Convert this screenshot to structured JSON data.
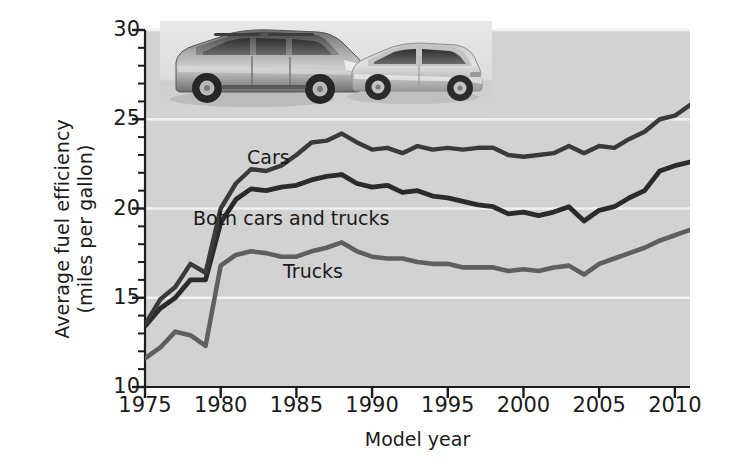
{
  "chart_data": {
    "type": "line",
    "title": "",
    "subtitle": "",
    "xlabel": "Model year",
    "ylabel": "Average fuel efficiency (miles per gallon)",
    "ylabel_line1": "Average fuel efficiency",
    "ylabel_line2": "(miles per gallon)",
    "xlim": [
      1975,
      2011
    ],
    "ylim": [
      10,
      30
    ],
    "xticks": [
      1975,
      1980,
      1985,
      1990,
      1995,
      2000,
      2005,
      2010
    ],
    "xtick_labels": [
      "1975",
      "1980",
      "1985",
      "1990",
      "1995",
      "2000",
      "2005",
      "2010"
    ],
    "yticks": [
      10,
      15,
      20,
      25,
      30
    ],
    "ytick_labels": [
      "10",
      "15",
      "20",
      "25",
      "30"
    ],
    "y_minor_tick_step": 1,
    "grid": "horizontal-white-gridlines-at-major-yticks",
    "legend": "inline-labels-on-curves",
    "plot_background": "#d2d2d2",
    "gridline_color": "#f2f2f2",
    "x": [
      1975,
      1976,
      1977,
      1978,
      1979,
      1980,
      1981,
      1982,
      1983,
      1984,
      1985,
      1986,
      1987,
      1988,
      1989,
      1990,
      1991,
      1992,
      1993,
      1994,
      1995,
      1996,
      1997,
      1998,
      1999,
      2000,
      2001,
      2002,
      2003,
      2004,
      2005,
      2006,
      2007,
      2008,
      2009,
      2010,
      2011
    ],
    "series": [
      {
        "name": "Cars",
        "color": "#3a3a3a",
        "values": [
          13.5,
          14.9,
          15.6,
          16.9,
          16.4,
          20.0,
          21.4,
          22.2,
          22.1,
          22.4,
          23.0,
          23.7,
          23.8,
          24.2,
          23.7,
          23.3,
          23.4,
          23.1,
          23.5,
          23.3,
          23.4,
          23.3,
          23.4,
          23.4,
          23.0,
          22.9,
          23.0,
          23.1,
          23.5,
          23.1,
          23.5,
          23.4,
          23.9,
          24.3,
          25.0,
          25.2,
          25.8
        ]
      },
      {
        "name": "Both cars and trucks",
        "color": "#2b2b2b",
        "values": [
          13.4,
          14.4,
          15.0,
          16.0,
          16.0,
          19.2,
          20.5,
          21.1,
          21.0,
          21.2,
          21.3,
          21.6,
          21.8,
          21.9,
          21.4,
          21.2,
          21.3,
          20.9,
          21.0,
          20.7,
          20.6,
          20.4,
          20.2,
          20.1,
          19.7,
          19.8,
          19.6,
          19.8,
          20.1,
          19.3,
          19.9,
          20.1,
          20.6,
          21.0,
          22.1,
          22.4,
          22.6
        ]
      },
      {
        "name": "Trucks",
        "color": "#5f5f5f",
        "values": [
          11.6,
          12.2,
          13.1,
          12.9,
          12.3,
          16.8,
          17.4,
          17.6,
          17.5,
          17.3,
          17.3,
          17.6,
          17.8,
          18.1,
          17.6,
          17.3,
          17.2,
          17.2,
          17.0,
          16.9,
          16.9,
          16.7,
          16.7,
          16.7,
          16.5,
          16.6,
          16.5,
          16.7,
          16.8,
          16.3,
          16.9,
          17.2,
          17.5,
          17.8,
          18.2,
          18.5,
          18.8
        ]
      }
    ]
  },
  "axes": {
    "x_title": "Model year",
    "y_title_line1": "Average fuel efficiency",
    "y_title_line2": "(miles per gallon)"
  },
  "series_labels": {
    "cars": "Cars",
    "both": "Both cars and trucks",
    "trucks": "Trucks"
  },
  "image": {
    "vehicles_alt": "photo of an SUV and a sedan"
  }
}
